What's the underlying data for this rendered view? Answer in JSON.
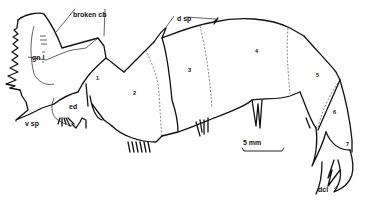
{
  "figure": {
    "labels": {
      "broken_cb": "broken cb",
      "gn_l": "gn l",
      "v_sp": "v sp",
      "ed": "ed",
      "d_sp": "d sp",
      "dcl": "dcl"
    },
    "segments": [
      "1",
      "2",
      "3",
      "4",
      "5",
      "6",
      "7"
    ],
    "scale_bar": {
      "label": "5 mm"
    },
    "colors": {
      "ink": "#111111",
      "background": "#ffffff"
    }
  }
}
